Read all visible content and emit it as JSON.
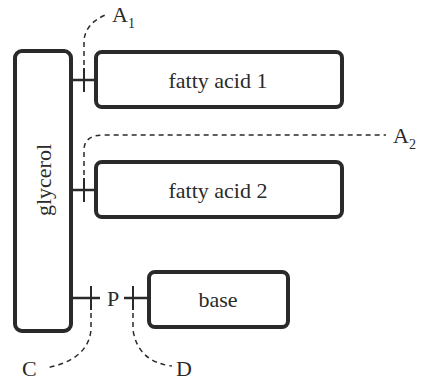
{
  "diagram": {
    "boxes": {
      "glycerol": "glycerol",
      "fatty_acid_1": "fatty acid 1",
      "fatty_acid_2": "fatty acid 2",
      "base": "base"
    },
    "phosphate": "P",
    "cleavage_sites": {
      "a1": {
        "letter": "A",
        "sub": "1"
      },
      "a2": {
        "letter": "A",
        "sub": "2"
      },
      "c": {
        "letter": "C"
      },
      "d": {
        "letter": "D"
      }
    },
    "colors": {
      "stroke": "#2a2a2a",
      "background": "#ffffff"
    }
  }
}
